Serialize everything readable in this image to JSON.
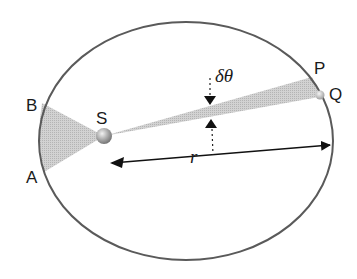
{
  "diagram": {
    "labels": {
      "sun": "S",
      "point_a": "A",
      "point_b": "B",
      "point_p": "P",
      "point_q": "Q",
      "radius": "r",
      "angle": "δθ"
    },
    "colors": {
      "orbit": "#5a5a5a",
      "wedge_fill": "#c8c8c8",
      "arrow": "#111111",
      "sun_light": "#e6e6e6",
      "sun_dark": "#7a7a7a"
    },
    "orbit": {
      "cx": 186,
      "cy": 141,
      "rx": 147,
      "ry": 119
    },
    "sun": {
      "x": 104,
      "y": 136,
      "r": 8
    },
    "planet": {
      "x": 320,
      "y": 95,
      "r": 4.5
    }
  }
}
